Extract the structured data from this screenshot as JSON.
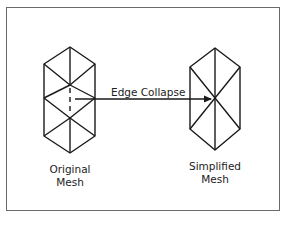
{
  "diagram": {
    "type": "mesh-simplification",
    "edge_operation_label": "Edge Collapse",
    "original_mesh": {
      "label_line1": "Original",
      "label_line2": "Mesh"
    },
    "simplified_mesh": {
      "label_line1": "Simplified",
      "label_line2": "Mesh"
    },
    "colors": {
      "stroke": "#1a1a1a",
      "frame": "#6a6a6a",
      "background": "#ffffff"
    }
  }
}
